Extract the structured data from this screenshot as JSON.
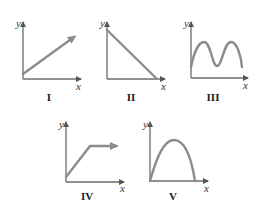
{
  "figure": {
    "colors": {
      "axis": "#6b6b6b",
      "curve": "#8c8c8c",
      "text": "#222222"
    },
    "graphs": [
      {
        "id": "I",
        "label": "I",
        "x_label": "x",
        "y_label": "y",
        "shape": "straight line increasing from near origin, with arrow"
      },
      {
        "id": "II",
        "label": "II",
        "x_label": "x",
        "y_label": "y",
        "shape": "straight line decreasing from y-axis to x-axis"
      },
      {
        "id": "III",
        "label": "III",
        "x_label": "x",
        "y_label": "y",
        "shape": "oscillating wave with two peaks"
      },
      {
        "id": "IV",
        "label": "IV",
        "x_label": "x",
        "y_label": "y",
        "shape": "linear increase then horizontal constant, with arrow"
      },
      {
        "id": "V",
        "label": "V",
        "x_label": "x",
        "y_label": "y",
        "shape": "inverted parabola starting and ending on x-axis"
      }
    ]
  }
}
